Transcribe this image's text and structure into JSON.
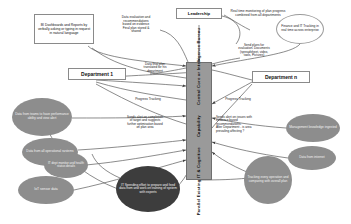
{
  "diagram": {
    "colors": {
      "ellipse_grey": "#8d8d8d",
      "ellipse_dark": "#3d3d3d",
      "bar_grey": "#9a9a9a",
      "box_border": "#8a8a8a",
      "connector": "#555555"
    },
    "center_bar": {
      "line1": "Parallel Existing IT & Cognitive",
      "line2": "Capability",
      "line3": "Central Core or Intelligence Bureau"
    },
    "boxes": [
      {
        "name": "bi-dashboards-box",
        "text": "BI Dashboards and Reports by verbally asking or typing in request in natural language"
      },
      {
        "name": "leadership-box",
        "text": "Leadership"
      },
      {
        "name": "department-1-box",
        "text": "Department 1"
      },
      {
        "name": "department-n-box",
        "text": "Department n"
      }
    ],
    "notes": [
      {
        "name": "data-evaluation-note",
        "line1": "Data evaluation and",
        "line2": "recommendations",
        "line3": "based on evidence",
        "line4": "Final plan stored &",
        "line5": "shared"
      },
      {
        "name": "real-time-monitoring-note",
        "text": "Real time monitoring of plan progress combined from all departments"
      },
      {
        "name": "send-plans-note",
        "line1": "Send plans for",
        "line2": "evaluation. Documents",
        "line3": "(spreadsheet, video,",
        "line4": "tools, Pictures)"
      },
      {
        "name": "data-final-plan-note",
        "line1": "Data final plan",
        "line2": "translated for his",
        "line3": "department"
      },
      {
        "name": "progress-tracking-left-note",
        "text": "Progress Tracking"
      },
      {
        "name": "progress-tracking-right-note",
        "text": "Progress Tracking"
      },
      {
        "name": "alert-completion-note",
        "line1": "Sends alert on completion",
        "line2": "of target and suggests",
        "line3": "further optimisation based",
        "line4": "on plan area"
      },
      {
        "name": "alert-issues-note",
        "line1": "Sends alert on issues with",
        "line2": "evidence based",
        "line3": "recommendations.",
        "line4": "Alter Department - is area",
        "line5": "prevailing affecting ?"
      }
    ],
    "ellipses": [
      {
        "name": "team-performance-ellipse",
        "style": "grey",
        "text": "Data from teams to have performance ability and view alert"
      },
      {
        "name": "operational-systems-ellipse",
        "style": "grey",
        "text": "Data from all operational systems"
      },
      {
        "name": "it-dept-monitor-ellipse",
        "style": "grey",
        "text": "IT dept monitor and health status details"
      },
      {
        "name": "iot-sensor-ellipse",
        "style": "grey",
        "text": "IoT sensor data"
      },
      {
        "name": "it-spending-ellipse",
        "style": "dark",
        "text": "IT Spending effort to prepare and feed data from and work on training of system with experts"
      },
      {
        "name": "management-knowledge-ellipse",
        "style": "grey",
        "text": "Management knowledge ingested"
      },
      {
        "name": "data-from-internet-ellipse",
        "style": "grey",
        "text": "Data from internet"
      },
      {
        "name": "tracking-operations-ellipse",
        "style": "grey",
        "text": "Tracking every operation and comparing with overall plan"
      },
      {
        "name": "finance-it-tracking-ellipse",
        "style": "open",
        "text": "Finance and IT Tracking in real time across enterprise"
      }
    ]
  }
}
